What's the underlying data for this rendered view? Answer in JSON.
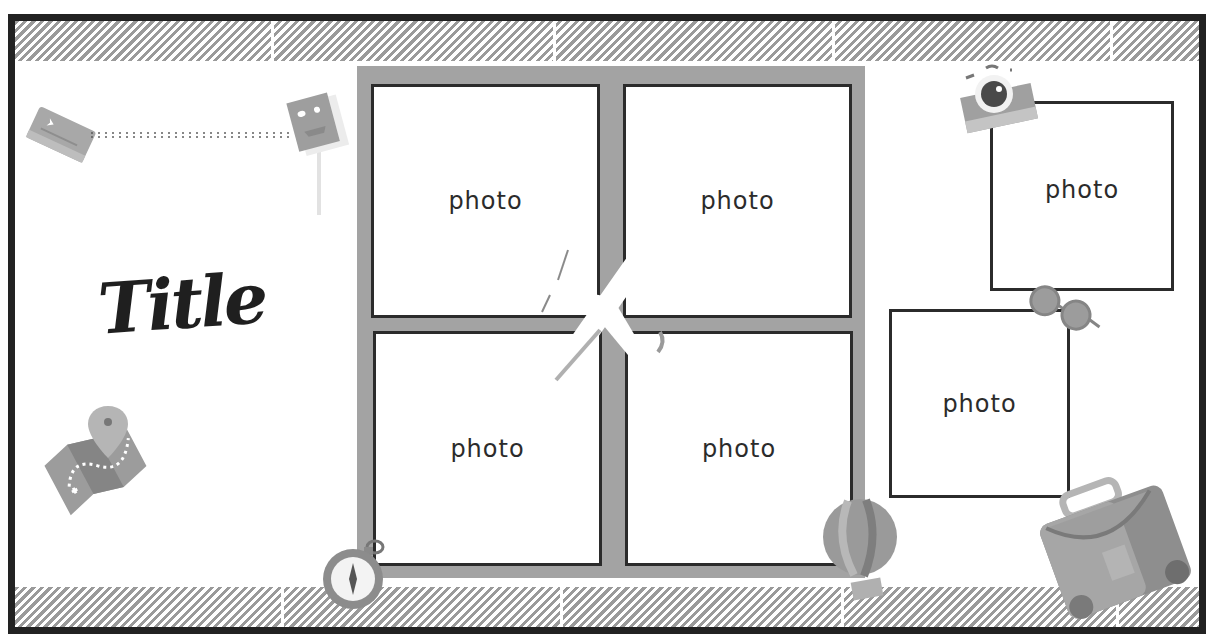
{
  "layout": {
    "title": "Title",
    "photo_placeholder_label": "photo",
    "photos": [
      {
        "id": "grid-top-left",
        "label": "photo"
      },
      {
        "id": "grid-top-right",
        "label": "photo"
      },
      {
        "id": "grid-bottom-left",
        "label": "photo"
      },
      {
        "id": "grid-bottom-right",
        "label": "photo"
      },
      {
        "id": "right-top",
        "label": "photo"
      },
      {
        "id": "right-bottom",
        "label": "photo"
      }
    ]
  },
  "decorations": [
    "ticket-icon",
    "spiral-string",
    "passport-card-icon",
    "map-pin-icon",
    "compass-icon",
    "airplane-icon",
    "camera-icon",
    "sunglasses-icon",
    "hot-air-balloon-icon",
    "suitcase-icon"
  ],
  "colors": {
    "border": "#222222",
    "stripe": "#9a9a9a",
    "frame": "#a3a3a3",
    "photo_border": "#2b2b2b",
    "background": "#ffffff"
  }
}
